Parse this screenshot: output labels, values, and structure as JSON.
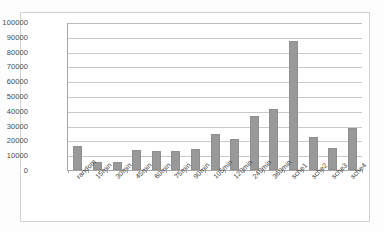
{
  "chart_data": {
    "type": "bar",
    "title": "",
    "subtitle": "",
    "xlabel": "",
    "ylabel": "",
    "ylim": [
      0,
      100000
    ],
    "ytick_labels": [
      "100000",
      "90000",
      "80000",
      "70000",
      "60000",
      "50000",
      "40000",
      "30000",
      "20000",
      "10000",
      "0"
    ],
    "ytick_values": [
      100000,
      90000,
      80000,
      70000,
      60000,
      50000,
      40000,
      30000,
      20000,
      10000,
      0
    ],
    "grid": true,
    "legend": false,
    "legend_position": "none",
    "bar_color": "#999999",
    "bar_border_color": "#8f8f8f",
    "gridline_color": "#c9c9c9",
    "axis_color": "#a6a6a6",
    "categories": [
      "random",
      "15min",
      "30min",
      "45min",
      "60min",
      "75min",
      "90min",
      "105min",
      "120min",
      "240min",
      "360min",
      "sche1",
      "sche2",
      "sche3",
      "sche4"
    ],
    "values": [
      16200,
      5700,
      5100,
      13700,
      12700,
      12900,
      14400,
      24300,
      20700,
      36800,
      41200,
      87200,
      22000,
      15200,
      28300
    ],
    "series": [
      {
        "name": "series1",
        "values": [
          16200,
          5700,
          5100,
          13700,
          12700,
          12900,
          14400,
          24300,
          20700,
          36800,
          41200,
          87200,
          22000,
          15200,
          28300
        ]
      }
    ]
  }
}
